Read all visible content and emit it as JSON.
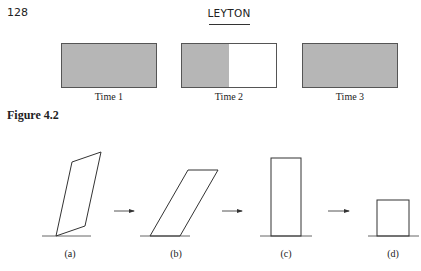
{
  "header": {
    "page_number": "128",
    "running_head": "LEYTON"
  },
  "figure_top": {
    "panels": [
      {
        "label": "Time 1",
        "fill_fraction": 1.0
      },
      {
        "label": "Time 2",
        "fill_fraction": 0.5
      },
      {
        "label": "Time 3",
        "fill_fraction": 1.0
      }
    ],
    "fill_color": "#b6b6b6",
    "border_color": "#555555"
  },
  "caption": {
    "text": "Figure 4.2"
  },
  "figure_bottom": {
    "shapes": [
      {
        "id": "a",
        "label": "(a)",
        "kind": "parallelogram-tilted"
      },
      {
        "id": "b",
        "label": "(b)",
        "kind": "parallelogram-sheared"
      },
      {
        "id": "c",
        "label": "(c)",
        "kind": "tall-rectangle"
      },
      {
        "id": "d",
        "label": "(d)",
        "kind": "square"
      }
    ],
    "arrows": [
      "right-arrow",
      "right-arrow",
      "right-arrow"
    ]
  }
}
